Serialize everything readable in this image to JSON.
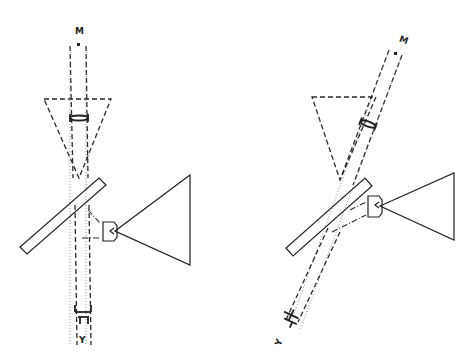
{
  "figure": {
    "panels": [
      {
        "id": "left",
        "top_label": "M",
        "bottom_label": "Y",
        "components": [
          "beam-path",
          "dashed-field-triangle",
          "lens",
          "beam-splitter-plate",
          "camera",
          "projection-cone",
          "eyepiece-bracket"
        ]
      },
      {
        "id": "right",
        "top_label": "M",
        "bottom_label": "Y",
        "components": [
          "tilted-beam-path",
          "dashed-field-triangle",
          "lens",
          "beam-splitter-plate",
          "camera",
          "projection-cone",
          "eyepiece-bracket"
        ]
      }
    ],
    "colors": {
      "line": "#222222",
      "background": "#ffffff"
    }
  }
}
